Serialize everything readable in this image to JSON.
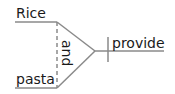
{
  "diagram": {
    "type": "sentence-diagram",
    "subjects": [
      "Rice",
      "pasta"
    ],
    "conjunction": "and",
    "predicate": "provide",
    "colors": {
      "line": "#8a8a8a",
      "text": "#1a1a1a"
    }
  }
}
